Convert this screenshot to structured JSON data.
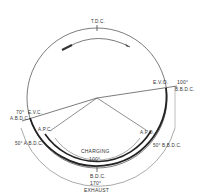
{
  "diagram": {
    "type": "valve timing diagram",
    "labels": {
      "tdc": "T.D.C.",
      "bdc": "B.D.C.",
      "evo": "E.V.O.",
      "evo_angle": "100°",
      "evo_ref": "B.B.D.C.",
      "evc": "E.V.C.",
      "evc_angle": "70°",
      "evc_ref": "A.B.D.C.",
      "apc": "A.P.C.",
      "apc_angle": "50° A.B.D.C.",
      "apo": "A.P.O.",
      "apo_angle": "50° B.B.D.C.",
      "charging": "CHARGING",
      "charging_angle": "100°",
      "exhaust_angle": "170°",
      "exhaust": "EXHAUST"
    },
    "colors": {
      "line": "#333333",
      "background": "#ffffff"
    }
  }
}
